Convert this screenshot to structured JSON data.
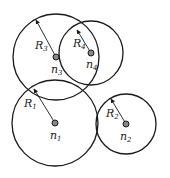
{
  "diagram": {
    "stroke_color": "#1a1a1a",
    "node_fill": "#888888",
    "nodes": [
      {
        "id": "n1",
        "label": "n",
        "sub": "1",
        "cx": 55,
        "cy": 123,
        "r": 43,
        "radius_label": "R",
        "radius_sub": "1",
        "arrow_to": [
          34,
          89
        ],
        "rlabel_pos": [
          24,
          107
        ],
        "nlabel_pos": [
          50,
          139
        ]
      },
      {
        "id": "n2",
        "label": "n",
        "sub": "2",
        "cx": 126,
        "cy": 124,
        "r": 30,
        "radius_label": "R",
        "radius_sub": "2",
        "arrow_to": [
          111,
          99
        ],
        "rlabel_pos": [
          106,
          117
        ],
        "nlabel_pos": [
          120,
          140
        ]
      },
      {
        "id": "n3",
        "label": "n",
        "sub": "3",
        "cx": 56,
        "cy": 57,
        "r": 43,
        "radius_label": "R",
        "radius_sub": "3",
        "arrow_to": [
          36,
          20
        ],
        "rlabel_pos": [
          35,
          49
        ],
        "nlabel_pos": [
          51,
          73
        ]
      },
      {
        "id": "n4",
        "label": "n",
        "sub": "4",
        "cx": 91,
        "cy": 53,
        "r": 32,
        "radius_label": "R",
        "radius_sub": "4",
        "arrow_to": [
          77,
          30
        ],
        "rlabel_pos": [
          73,
          47
        ],
        "nlabel_pos": [
          86,
          68
        ]
      }
    ]
  }
}
